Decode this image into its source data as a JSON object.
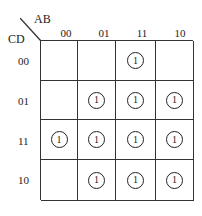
{
  "kmap": {
    "row_var": "CD",
    "col_var": "AB",
    "col_labels": [
      "00",
      "01",
      "11",
      "10"
    ],
    "row_labels": [
      "00",
      "01",
      "11",
      "10"
    ],
    "cells": [
      [
        "",
        "",
        "1",
        ""
      ],
      [
        "",
        "1",
        "1",
        "1"
      ],
      [
        "1",
        "1",
        "1",
        "1"
      ],
      [
        "",
        "1",
        "1",
        "1"
      ]
    ]
  }
}
